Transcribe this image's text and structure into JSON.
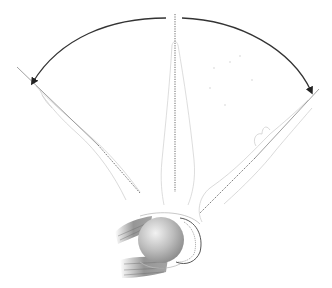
{
  "figure": {
    "positions": [
      "rotated-left",
      "neutral",
      "rotated-right"
    ],
    "arrows": [
      "arc-left",
      "arc-right"
    ],
    "colors": {
      "arc": "#333333",
      "outline": "#c8c8c8",
      "axis": "#555555",
      "ball_light": "#eeeeee",
      "ball_dark": "#8a8a8a",
      "muscle": "#7a7a7a"
    }
  }
}
